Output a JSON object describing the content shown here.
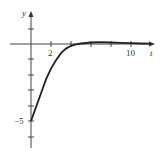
{
  "chart_data": {
    "type": "line",
    "title": "",
    "xlabel": "t",
    "ylabel": "y",
    "x_tick_labels": [
      "2",
      "10"
    ],
    "y_tick_labels": [
      "-5"
    ],
    "xlim": [
      -1.3,
      13.2
    ],
    "ylim": [
      -7,
      2.8
    ],
    "grid": false,
    "series": [
      {
        "name": "y(t)",
        "x": [
          0,
          0.5,
          1,
          1.5,
          2,
          2.5,
          3,
          3.5,
          4,
          4.5,
          5,
          6,
          7,
          8,
          9,
          10,
          11,
          12
        ],
        "values": [
          -5,
          -4.1,
          -3.2,
          -2.3,
          -1.6,
          -1.05,
          -0.6,
          -0.3,
          -0.12,
          -0.02,
          0.03,
          0.1,
          0.12,
          0.1,
          0.07,
          0.05,
          0.03,
          0.02
        ]
      }
    ]
  },
  "labels": {
    "x_axis": "t",
    "y_axis": "y",
    "x_tick_2": "2",
    "x_tick_10": "10",
    "y_tick_neg5": "−5"
  }
}
